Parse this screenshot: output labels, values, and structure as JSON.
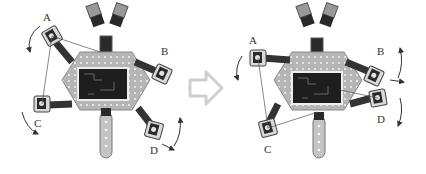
{
  "diagram": {
    "colors": {
      "body": "#b8b8b8",
      "body_stroke": "#8a8a8a",
      "board": "#1e1e1e",
      "servo": "#2a2a2a",
      "bracket": "#d6d6d6",
      "arrow": "#cfcfcf",
      "line": "#555555"
    },
    "panels": [
      {
        "name": "initial-pose",
        "legs": [
          {
            "label": "A",
            "x": 40,
            "y": 14
          },
          {
            "label": "B",
            "x": 163,
            "y": 46
          },
          {
            "label": "C",
            "x": 36,
            "y": 119
          },
          {
            "label": "D",
            "x": 152,
            "y": 146
          }
        ]
      },
      {
        "name": "next-pose",
        "legs": [
          {
            "label": "A",
            "x": 249,
            "y": 36
          },
          {
            "label": "B",
            "x": 377,
            "y": 47
          },
          {
            "label": "C",
            "x": 264,
            "y": 145
          },
          {
            "label": "D",
            "x": 377,
            "y": 114
          }
        ]
      }
    ],
    "transition_arrow": {
      "direction": "right"
    }
  }
}
